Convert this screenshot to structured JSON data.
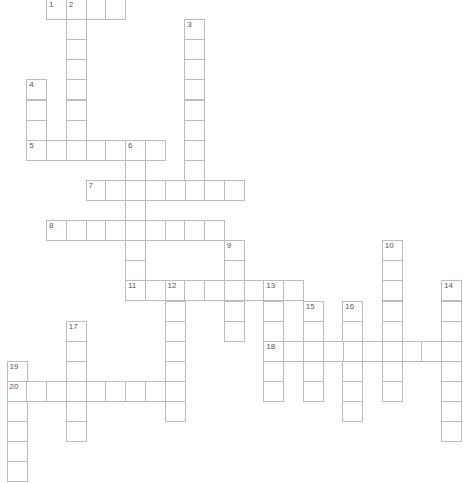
{
  "puzzle": {
    "type": "crossword",
    "entries": [
      {
        "number": "1",
        "direction": "across",
        "row": 0,
        "col": 2,
        "length": 4
      },
      {
        "number": "2",
        "direction": "down",
        "row": 0,
        "col": 3,
        "length": 8
      },
      {
        "number": "3",
        "direction": "down",
        "row": 1,
        "col": 9,
        "length": 9
      },
      {
        "number": "4",
        "direction": "down",
        "row": 4,
        "col": 1,
        "length": 4
      },
      {
        "number": "5",
        "direction": "across",
        "row": 7,
        "col": 1,
        "length": 7
      },
      {
        "number": "6",
        "direction": "down",
        "row": 7,
        "col": 6,
        "length": 8
      },
      {
        "number": "7",
        "direction": "across",
        "row": 9,
        "col": 4,
        "length": 8
      },
      {
        "number": "8",
        "direction": "across",
        "row": 11,
        "col": 2,
        "length": 9
      },
      {
        "number": "9",
        "direction": "down",
        "row": 12,
        "col": 11,
        "length": 5
      },
      {
        "number": "10",
        "direction": "down",
        "row": 12,
        "col": 19,
        "length": 8
      },
      {
        "number": "11",
        "direction": "across",
        "row": 14,
        "col": 6,
        "length": 9
      },
      {
        "number": "12",
        "direction": "down",
        "row": 14,
        "col": 8,
        "length": 7
      },
      {
        "number": "13",
        "direction": "down",
        "row": 14,
        "col": 13,
        "length": 6
      },
      {
        "number": "14",
        "direction": "down",
        "row": 14,
        "col": 22,
        "length": 8
      },
      {
        "number": "15",
        "direction": "down",
        "row": 15,
        "col": 15,
        "length": 5
      },
      {
        "number": "16",
        "direction": "down",
        "row": 15,
        "col": 17,
        "length": 6
      },
      {
        "number": "17",
        "direction": "down",
        "row": 16,
        "col": 3,
        "length": 6
      },
      {
        "number": "18",
        "direction": "across",
        "row": 17,
        "col": 13,
        "length": 10
      },
      {
        "number": "19",
        "direction": "down",
        "row": 18,
        "col": 0,
        "length": 6
      },
      {
        "number": "20",
        "direction": "across",
        "row": 19,
        "col": 0,
        "length": 9
      }
    ]
  },
  "colors": {
    "cell_border": "#bdbdbd",
    "cell_fill": "#ffffff",
    "number_text": "#555555"
  }
}
